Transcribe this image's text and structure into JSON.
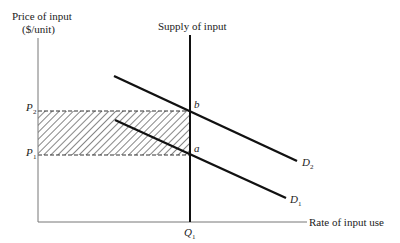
{
  "diagram": {
    "y_axis_label_line1": "Price of input",
    "y_axis_label_line2": "($/unit)",
    "x_axis_label": "Rate of input use",
    "supply_label": "Supply of input",
    "p2": "P",
    "p2_sub": "2",
    "p1": "P",
    "p1_sub": "1",
    "q1": "Q",
    "q1_sub": "1",
    "point_b": "b",
    "point_a": "a",
    "d2": "D",
    "d2_sub": "2",
    "d1": "D",
    "d1_sub": "1"
  }
}
